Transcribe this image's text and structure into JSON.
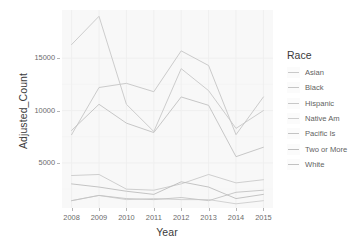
{
  "chart_data": {
    "type": "line",
    "title": "",
    "xlabel": "Year",
    "ylabel": "Adjusted_Count",
    "x": [
      2008,
      2009,
      2010,
      2011,
      2012,
      2013,
      2014,
      2015
    ],
    "xticklabels": [
      "2008",
      "2009",
      "2010",
      "2011",
      "2012",
      "2013",
      "2014",
      "2015"
    ],
    "yticks": [
      5000,
      10000,
      15000
    ],
    "yticklabels": [
      "5000",
      "10000",
      "15000"
    ],
    "xlim": [
      2007.65,
      2015.35
    ],
    "ylim": [
      700,
      19600
    ],
    "grid": true,
    "legend_position": "right",
    "legend_title": "Race",
    "series": [
      {
        "name": "Asian",
        "color": "#c9c9c9",
        "values": [
          3800,
          3900,
          2500,
          2400,
          3000,
          3900,
          3100,
          3400
        ]
      },
      {
        "name": "Black",
        "color": "#c5c5c5",
        "values": [
          7700,
          12200,
          12600,
          11800,
          15700,
          14300,
          7700,
          11300
        ]
      },
      {
        "name": "Hispanic",
        "color": "#c7c7c7",
        "values": [
          16300,
          19000,
          10600,
          8000,
          14000,
          11900,
          8300,
          10000
        ]
      },
      {
        "name": "Native Am",
        "color": "#cdcdcd",
        "values": [
          1400,
          1900,
          1500,
          1600,
          1500,
          1500,
          1100,
          1400
        ]
      },
      {
        "name": "Pacific Is",
        "color": "#c3c3c3",
        "values": [
          1400,
          1900,
          1600,
          1500,
          1700,
          1400,
          2200,
          2400
        ]
      },
      {
        "name": "Two or More",
        "color": "#bdbdbd",
        "values": [
          3000,
          2700,
          2300,
          2000,
          3200,
          2700,
          1600,
          2000
        ]
      },
      {
        "name": "White",
        "color": "#c1c1c1",
        "values": [
          8100,
          10600,
          8800,
          7900,
          11300,
          10500,
          5600,
          6500
        ]
      }
    ]
  },
  "axes": {
    "y_title": "Adjusted_Count",
    "x_title": "Year"
  },
  "legend": {
    "title": "Race",
    "items": [
      {
        "label": "Asian"
      },
      {
        "label": "Black"
      },
      {
        "label": "Hispanic"
      },
      {
        "label": "Native Am"
      },
      {
        "label": "Pacific Is"
      },
      {
        "label": "Two or More"
      },
      {
        "label": "White"
      }
    ]
  }
}
